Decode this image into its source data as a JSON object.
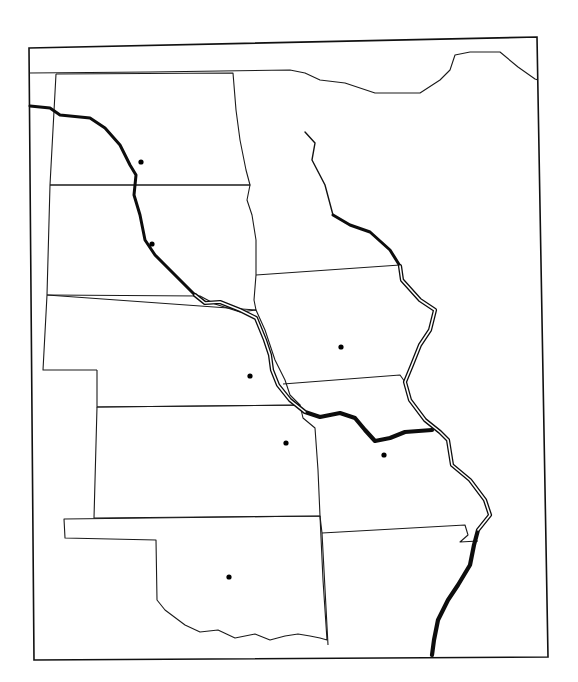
{
  "map": {
    "type": "blank outline map",
    "region": "US Plains and Midwest",
    "labels_visible": false,
    "colors": {
      "background": "#ffffff",
      "ink": "#111111"
    },
    "states": [
      {
        "id": "north-dakota",
        "capital_dot": [
          141,
          162
        ]
      },
      {
        "id": "south-dakota",
        "capital_dot": [
          152,
          244
        ]
      },
      {
        "id": "nebraska",
        "capital_dot": [
          250,
          376
        ]
      },
      {
        "id": "kansas",
        "capital_dot": [
          286,
          443
        ]
      },
      {
        "id": "oklahoma",
        "capital_dot": [
          229,
          577
        ]
      },
      {
        "id": "minnesota",
        "capital_dot": null
      },
      {
        "id": "iowa",
        "capital_dot": [
          341,
          347
        ]
      },
      {
        "id": "missouri",
        "capital_dot": [
          384,
          455
        ]
      },
      {
        "id": "arkansas",
        "capital_dot": null
      }
    ],
    "rivers": [
      "missouri-river",
      "mississippi-river"
    ],
    "capital_dot_count": 7
  }
}
